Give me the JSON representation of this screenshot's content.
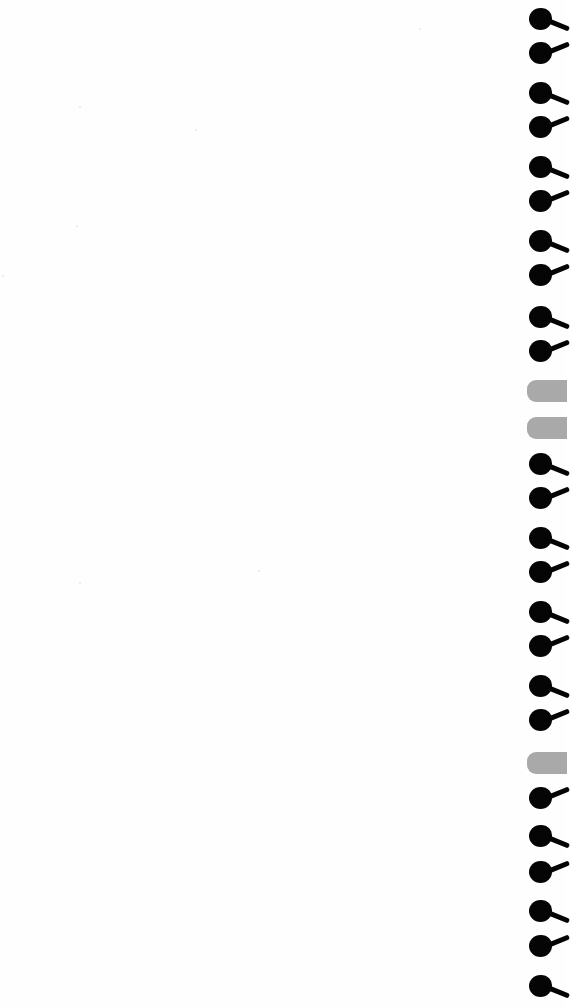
{
  "notebook": {
    "page_color": "#fefefe",
    "ring_color": "#050505",
    "tab_color": "#a9a9a9",
    "binding": [
      {
        "type": "ring",
        "y": 8,
        "dir": "down"
      },
      {
        "type": "ring",
        "y": 42,
        "dir": "up"
      },
      {
        "type": "ring",
        "y": 82,
        "dir": "down"
      },
      {
        "type": "ring",
        "y": 116,
        "dir": "up"
      },
      {
        "type": "ring",
        "y": 156,
        "dir": "down"
      },
      {
        "type": "ring",
        "y": 190,
        "dir": "up"
      },
      {
        "type": "ring",
        "y": 230,
        "dir": "down"
      },
      {
        "type": "ring",
        "y": 264,
        "dir": "up"
      },
      {
        "type": "ring",
        "y": 306,
        "dir": "down"
      },
      {
        "type": "ring",
        "y": 340,
        "dir": "up"
      },
      {
        "type": "tab",
        "y": 380
      },
      {
        "type": "tab",
        "y": 417
      },
      {
        "type": "ring",
        "y": 453,
        "dir": "down"
      },
      {
        "type": "ring",
        "y": 487,
        "dir": "up"
      },
      {
        "type": "ring",
        "y": 527,
        "dir": "down"
      },
      {
        "type": "ring",
        "y": 561,
        "dir": "up"
      },
      {
        "type": "ring",
        "y": 601,
        "dir": "down"
      },
      {
        "type": "ring",
        "y": 635,
        "dir": "up"
      },
      {
        "type": "ring",
        "y": 675,
        "dir": "down"
      },
      {
        "type": "ring",
        "y": 709,
        "dir": "up"
      },
      {
        "type": "tab",
        "y": 752
      },
      {
        "type": "ring",
        "y": 787,
        "dir": "up"
      },
      {
        "type": "ring",
        "y": 825,
        "dir": "down"
      },
      {
        "type": "ring",
        "y": 861,
        "dir": "up"
      },
      {
        "type": "ring",
        "y": 900,
        "dir": "down"
      },
      {
        "type": "ring",
        "y": 935,
        "dir": "up"
      },
      {
        "type": "ring",
        "y": 975,
        "dir": "down"
      }
    ],
    "specks": [
      {
        "x": 419,
        "y": 28
      },
      {
        "x": 79,
        "y": 106
      },
      {
        "x": 195,
        "y": 129
      },
      {
        "x": 76,
        "y": 225
      },
      {
        "x": 2,
        "y": 275
      },
      {
        "x": 258,
        "y": 570
      },
      {
        "x": 79,
        "y": 582
      }
    ]
  }
}
